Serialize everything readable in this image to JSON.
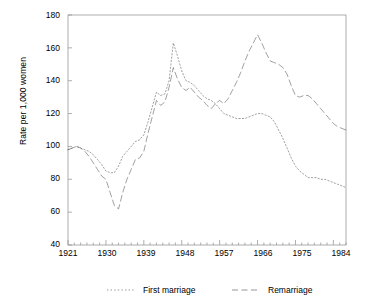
{
  "chart_data": {
    "type": "line",
    "title": "",
    "xlabel": "",
    "ylabel": "Rate per 1,000 women",
    "xlim": [
      1921,
      1987
    ],
    "ylim": [
      40,
      180
    ],
    "yticks": [
      40,
      60,
      80,
      100,
      120,
      140,
      160,
      180
    ],
    "xticks": [
      1921,
      1930,
      1939,
      1948,
      1957,
      1966,
      1975,
      1984
    ],
    "grid": false,
    "legend_position": "bottom",
    "series": [
      {
        "name": "First marriage",
        "style": "dotted",
        "color": "#555555",
        "points": [
          [
            1921,
            98
          ],
          [
            1922,
            99
          ],
          [
            1923,
            100
          ],
          [
            1924,
            99
          ],
          [
            1925,
            98
          ],
          [
            1926,
            97
          ],
          [
            1927,
            95
          ],
          [
            1928,
            92
          ],
          [
            1929,
            89
          ],
          [
            1930,
            85
          ],
          [
            1931,
            84
          ],
          [
            1932,
            84
          ],
          [
            1933,
            88
          ],
          [
            1934,
            94
          ],
          [
            1935,
            97
          ],
          [
            1936,
            100
          ],
          [
            1937,
            103
          ],
          [
            1938,
            104
          ],
          [
            1939,
            107
          ],
          [
            1940,
            115
          ],
          [
            1941,
            124
          ],
          [
            1942,
            133
          ],
          [
            1943,
            131
          ],
          [
            1944,
            132
          ],
          [
            1945,
            140
          ],
          [
            1946,
            163
          ],
          [
            1947,
            155
          ],
          [
            1948,
            146
          ],
          [
            1949,
            140
          ],
          [
            1950,
            139
          ],
          [
            1951,
            137
          ],
          [
            1952,
            134
          ],
          [
            1953,
            131
          ],
          [
            1954,
            129
          ],
          [
            1955,
            128
          ],
          [
            1956,
            126
          ],
          [
            1957,
            123
          ],
          [
            1958,
            120
          ],
          [
            1959,
            119
          ],
          [
            1960,
            118
          ],
          [
            1961,
            117
          ],
          [
            1962,
            117
          ],
          [
            1963,
            117
          ],
          [
            1964,
            118
          ],
          [
            1965,
            119
          ],
          [
            1966,
            120
          ],
          [
            1967,
            120
          ],
          [
            1968,
            119
          ],
          [
            1969,
            118
          ],
          [
            1970,
            115
          ],
          [
            1971,
            110
          ],
          [
            1972,
            105
          ],
          [
            1973,
            99
          ],
          [
            1974,
            93
          ],
          [
            1975,
            88
          ],
          [
            1976,
            85
          ],
          [
            1977,
            83
          ],
          [
            1978,
            81
          ],
          [
            1979,
            81
          ],
          [
            1980,
            81
          ],
          [
            1981,
            80
          ],
          [
            1982,
            80
          ],
          [
            1983,
            79
          ],
          [
            1984,
            78
          ],
          [
            1985,
            77
          ],
          [
            1986,
            76
          ],
          [
            1987,
            75
          ]
        ]
      },
      {
        "name": "Remarriage",
        "style": "dashed",
        "color": "#555555",
        "points": [
          [
            1921,
            98
          ],
          [
            1922,
            99
          ],
          [
            1923,
            100
          ],
          [
            1924,
            99
          ],
          [
            1925,
            97
          ],
          [
            1926,
            94
          ],
          [
            1927,
            90
          ],
          [
            1928,
            86
          ],
          [
            1929,
            82
          ],
          [
            1930,
            80
          ],
          [
            1931,
            72
          ],
          [
            1932,
            64
          ],
          [
            1933,
            62
          ],
          [
            1934,
            72
          ],
          [
            1935,
            80
          ],
          [
            1936,
            86
          ],
          [
            1937,
            92
          ],
          [
            1938,
            93
          ],
          [
            1939,
            97
          ],
          [
            1940,
            108
          ],
          [
            1941,
            118
          ],
          [
            1942,
            128
          ],
          [
            1943,
            125
          ],
          [
            1944,
            127
          ],
          [
            1945,
            136
          ],
          [
            1946,
            148
          ],
          [
            1947,
            141
          ],
          [
            1948,
            136
          ],
          [
            1949,
            134
          ],
          [
            1950,
            136
          ],
          [
            1951,
            133
          ],
          [
            1952,
            130
          ],
          [
            1953,
            128
          ],
          [
            1954,
            125
          ],
          [
            1955,
            123
          ],
          [
            1956,
            126
          ],
          [
            1957,
            128
          ],
          [
            1958,
            126
          ],
          [
            1959,
            129
          ],
          [
            1960,
            134
          ],
          [
            1961,
            139
          ],
          [
            1962,
            145
          ],
          [
            1963,
            152
          ],
          [
            1964,
            158
          ],
          [
            1965,
            163
          ],
          [
            1966,
            168
          ],
          [
            1967,
            163
          ],
          [
            1968,
            157
          ],
          [
            1969,
            152
          ],
          [
            1970,
            151
          ],
          [
            1971,
            150
          ],
          [
            1972,
            148
          ],
          [
            1973,
            144
          ],
          [
            1974,
            137
          ],
          [
            1975,
            131
          ],
          [
            1976,
            130
          ],
          [
            1977,
            131
          ],
          [
            1978,
            131
          ],
          [
            1979,
            129
          ],
          [
            1980,
            126
          ],
          [
            1981,
            123
          ],
          [
            1982,
            120
          ],
          [
            1983,
            117
          ],
          [
            1984,
            114
          ],
          [
            1985,
            112
          ],
          [
            1986,
            111
          ],
          [
            1987,
            110
          ]
        ]
      }
    ]
  },
  "axis": {
    "ylabel": "Rate per 1,000 women",
    "ytick_labels": [
      "180",
      "160",
      "140",
      "120",
      "100",
      "80",
      "60",
      "40"
    ],
    "xtick_labels": [
      "1921",
      "1930",
      "1939",
      "1948",
      "1957",
      "1966",
      "1975",
      "1984"
    ]
  },
  "legend": {
    "items": [
      {
        "label": "First marriage"
      },
      {
        "label": "Remarriage"
      }
    ]
  }
}
